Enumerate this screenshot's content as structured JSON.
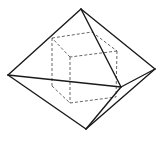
{
  "figure": {
    "colors": {
      "background": "#ffffff",
      "solid_edges": "#1a1a1a",
      "hidden_edges": "#555555"
    },
    "octahedron": {
      "vertices": {
        "top": [
          81,
          9
        ],
        "left": [
          8,
          75
        ],
        "right": [
          155,
          69
        ],
        "front": [
          121,
          87
        ],
        "bottom": [
          86,
          129
        ]
      },
      "edges": [
        [
          "top",
          "left"
        ],
        [
          "top",
          "right"
        ],
        [
          "top",
          "front"
        ],
        [
          "left",
          "front"
        ],
        [
          "front",
          "right"
        ],
        [
          "left",
          "bottom"
        ],
        [
          "right",
          "bottom"
        ],
        [
          "front",
          "bottom"
        ]
      ]
    },
    "cube": {
      "vertices": {
        "tbl": [
          52,
          38
        ],
        "tbr": [
          92,
          32
        ],
        "tfr": [
          117,
          51
        ],
        "tfl": [
          70,
          57
        ],
        "bbl": [
          52,
          86
        ],
        "bbr": [
          92,
          80
        ],
        "bfr": [
          116,
          97
        ],
        "bfl": [
          70,
          103
        ]
      },
      "edges": [
        [
          "tbl",
          "tbr"
        ],
        [
          "tbr",
          "tfr"
        ],
        [
          "tfr",
          "tfl"
        ],
        [
          "tfl",
          "tbl"
        ],
        [
          "bbl",
          "bfl"
        ],
        [
          "bfl",
          "bfr"
        ],
        [
          "tbl",
          "bbl"
        ],
        [
          "tfl",
          "bfl"
        ],
        [
          "tfr",
          "bfr"
        ]
      ]
    }
  }
}
